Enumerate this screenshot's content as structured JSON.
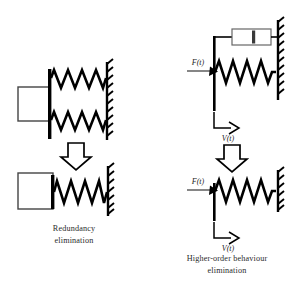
{
  "figure": {
    "title": "",
    "background_color": "#ffffff",
    "stroke_color": "#000000",
    "text_color": "#2b2b2b"
  },
  "captions": {
    "left": {
      "line1": "Redundancy",
      "line2": "elimination"
    },
    "right": {
      "line1": "Higher-order behaviour",
      "line2": "elimination"
    }
  },
  "labels": {
    "force_top_right": "F(t)",
    "velocity_top_right": "V(t)",
    "force_bottom_right": "F(t)",
    "velocity_bottom_right": "V(t)"
  },
  "panels": [
    {
      "id": "top-left",
      "name": "mass-two-parallel-springs",
      "elements": [
        "mass-block",
        "spring-upper",
        "spring-lower",
        "fixed-wall"
      ],
      "spring_count": 2,
      "damper_count": 0,
      "has_mass_block": true
    },
    {
      "id": "bottom-left",
      "name": "mass-single-spring",
      "elements": [
        "mass-block",
        "spring",
        "fixed-wall"
      ],
      "spring_count": 1,
      "damper_count": 0,
      "has_mass_block": true
    },
    {
      "id": "top-right",
      "name": "spring-damper-parallel-with-force-input",
      "elements": [
        "damper",
        "spring",
        "fixed-wall",
        "force-arrow",
        "velocity-arrow",
        "connecting-bar"
      ],
      "spring_count": 1,
      "damper_count": 1,
      "has_mass_block": false
    },
    {
      "id": "bottom-right",
      "name": "spring-only-with-force-input",
      "elements": [
        "spring",
        "fixed-wall",
        "force-arrow",
        "velocity-arrow",
        "connecting-bar"
      ],
      "spring_count": 1,
      "damper_count": 0,
      "has_mass_block": false
    }
  ],
  "arrows": {
    "left_block_arrow": "down-block-arrow",
    "right_block_arrow": "down-block-arrow"
  }
}
